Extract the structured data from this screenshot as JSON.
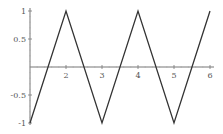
{
  "chart_data": {
    "type": "line",
    "title": "",
    "xlabel": "",
    "ylabel": "",
    "x": [
      1,
      2,
      3,
      4,
      5,
      6
    ],
    "series": [
      {
        "name": "triangle wave",
        "values": [
          -1,
          1,
          -1,
          1,
          -1,
          1
        ]
      }
    ],
    "xlim": [
      1,
      6.1
    ],
    "ylim": [
      -1,
      1
    ],
    "x_ticks": [
      "2",
      "3",
      "4",
      "5",
      "6"
    ],
    "y_ticks": [
      "1",
      "0.5",
      "-0.5",
      "-1"
    ],
    "grid": false,
    "legend": "none"
  },
  "colors": {
    "line": "#333333",
    "axis": "#777777",
    "label": "#555555"
  }
}
